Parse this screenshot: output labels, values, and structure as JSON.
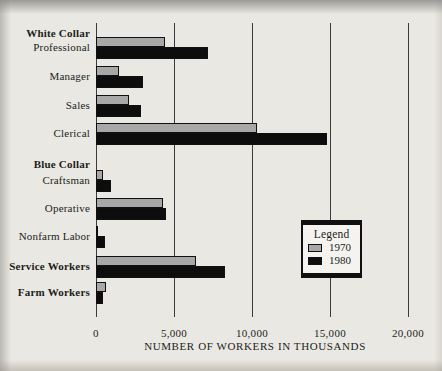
{
  "colors": {
    "paper": "#eae8e2",
    "text": "#201e1b",
    "gridline": "#3b3b3b",
    "legend_bg": "#f5f3ef"
  },
  "chart_data": {
    "type": "bar",
    "orientation": "horizontal",
    "title": "",
    "xlabel": "NUMBER OF WORKERS IN THOUSANDS",
    "ylabel": "",
    "xlim": [
      0,
      20000
    ],
    "grid": "vertical-lines-at-ticks",
    "xticks": [
      {
        "value": 0,
        "label": "0"
      },
      {
        "value": 5000,
        "label": "5,000"
      },
      {
        "value": 10000,
        "label": "10,000"
      },
      {
        "value": 15000,
        "label": "15,000"
      },
      {
        "value": 20000,
        "label": "20,000"
      }
    ],
    "series": [
      {
        "name": "1970",
        "color": "#a8a8a8"
      },
      {
        "name": "1980",
        "color": "#0d0d0d"
      }
    ],
    "legend": {
      "title": "Legend",
      "position": "middle-right",
      "entries": [
        {
          "label": "1970"
        },
        {
          "label": "1980"
        }
      ]
    },
    "rows": [
      {
        "label": "White Collar",
        "header": true,
        "bold": true
      },
      {
        "label": "Professional",
        "values": {
          "1970": 4400,
          "1980": 7200
        }
      },
      {
        "label": "Manager",
        "values": {
          "1970": 1500,
          "1980": 3000
        }
      },
      {
        "label": "Sales",
        "values": {
          "1970": 2100,
          "1980": 2900
        }
      },
      {
        "label": "Clerical",
        "values": {
          "1970": 10300,
          "1980": 14800
        }
      },
      {
        "label": "Blue Collar",
        "header": true,
        "bold": true
      },
      {
        "label": "Craftsman",
        "values": {
          "1970": 450,
          "1980": 950
        }
      },
      {
        "label": "Operative",
        "values": {
          "1970": 4300,
          "1980": 4500
        }
      },
      {
        "label": "Nonfarm Labor",
        "values": {
          "1970": 150,
          "1980": 600
        }
      },
      {
        "label": "Service Workers",
        "bold": true,
        "values": {
          "1970": 6400,
          "1980": 8300
        }
      },
      {
        "label": "Farm Workers",
        "bold": true,
        "values": {
          "1970": 650,
          "1980": 450
        }
      }
    ],
    "layout": {
      "plot_px": {
        "left": 96,
        "top": 23,
        "width": 312,
        "height": 294
      },
      "row_centers_px": [
        33,
        47,
        76,
        105,
        133,
        164,
        180,
        208,
        236,
        266,
        292
      ],
      "bar_heights_px": {
        "1970": 10,
        "1980": 12
      }
    }
  }
}
